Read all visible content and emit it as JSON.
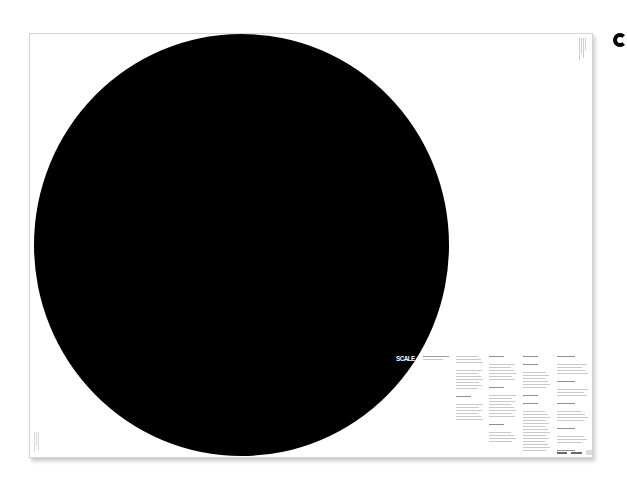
{
  "poster": {
    "title": "SCALE",
    "background_color": "#ffffff",
    "circle_color": "#000000",
    "title_color": "#ffffff",
    "text_color": "#c9c9c9",
    "intro_text_lines": 2,
    "text_columns": [
      {
        "x": 426,
        "width": 28,
        "blocks": [
          3,
          7,
          1,
          6
        ]
      },
      {
        "x": 459,
        "width": 28,
        "blocks": [
          1,
          6,
          1,
          8,
          1,
          4
        ]
      },
      {
        "x": 493,
        "width": 28,
        "blocks": [
          1,
          1,
          6,
          1,
          1,
          14
        ]
      },
      {
        "x": 527,
        "width": 32,
        "blocks": [
          1,
          4,
          1,
          3,
          1,
          4,
          1,
          3,
          1,
          4
        ]
      }
    ],
    "footer_marks": [
      10,
      11
    ]
  },
  "adjacent": {
    "partial_glyph": "next-poster-edge"
  }
}
